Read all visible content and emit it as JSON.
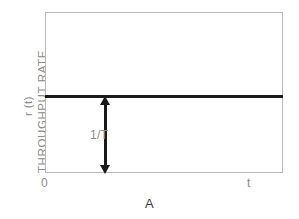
{
  "chart_data": {
    "type": "line",
    "title": "",
    "subtitle": "",
    "caption": "A",
    "xlabel": "t",
    "ylabel": "THROUGHPUT RATE",
    "ylabel_symbol": "r (t)",
    "xtick_labels": [
      "0",
      "t"
    ],
    "ytick_labels": [],
    "grid": false,
    "legend": null,
    "xlim": [
      0,
      1
    ],
    "ylim": [
      0,
      1
    ],
    "series": [
      {
        "name": "throughput rate r(t)",
        "style": "constant-horizontal",
        "x": [
          0,
          1
        ],
        "values": [
          0.485,
          0.485
        ],
        "color": "#1a1a1a"
      }
    ],
    "annotations": [
      {
        "name": "rate-magnitude-arrow",
        "label": "1/T",
        "type": "double-headed-vertical-arrow",
        "x": 0.25,
        "y_from": 0.0,
        "y_to": 0.485,
        "color": "#1a1a1a",
        "label_color": "#8c8c8c"
      }
    ],
    "colors": {
      "frame": "#b9b9b9",
      "axis_text": "#8c8c8c",
      "data_line": "#1a1a1a",
      "caption": "#3a3a3a",
      "background": "#ffffff"
    }
  }
}
